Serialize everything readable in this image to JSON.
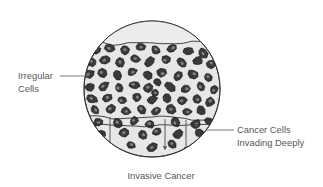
{
  "figure": {
    "caption": "Invasive Cancer",
    "field_shape": "circle",
    "colors": {
      "background": "#ffffff",
      "field_fill": "#e7e7e7",
      "field_fill_upper": "#ededed",
      "field_outline": "#2b2b2b",
      "cell_fill": "#3a3a3a",
      "cell_outline": "#111111",
      "nucleus_fill": "#8f8f8f",
      "membrane_line": "#2b2b2b",
      "arrow": "#4a4a4a",
      "leader_line": "#6a6a6a",
      "text": "#58585a"
    }
  },
  "labels": [
    {
      "id": "irregular-cells",
      "lines": [
        "Irregular",
        "Cells"
      ],
      "side": "left",
      "leader": {
        "x1": 60,
        "y1": 76,
        "x2": 90,
        "y2": 76
      }
    },
    {
      "id": "cancer-cells-invading-deeply",
      "lines": [
        "Cancer Cells",
        "Invading Deeply"
      ],
      "side": "right",
      "leader": {
        "x1": 206,
        "y1": 130,
        "x2": 234,
        "y2": 130
      }
    }
  ],
  "field": {
    "center_x": 152,
    "center_y": 89,
    "radius": 68,
    "surface_line_y": 43,
    "basement_line_y": 118,
    "basement_line2_y": 125
  },
  "arrows": [
    {
      "x": 110,
      "y_start": 117,
      "y_end": 146
    },
    {
      "x": 165,
      "y_start": 119,
      "y_end": 148
    },
    {
      "x": 186,
      "y_start": 120,
      "y_end": 149
    }
  ],
  "cells": [
    {
      "cx": 96,
      "cy": 50,
      "rx": 5.0,
      "ry": 4.0,
      "rot": -20
    },
    {
      "cx": 110,
      "cy": 48,
      "rx": 5.4,
      "ry": 4.2,
      "rot": 15
    },
    {
      "cx": 125,
      "cy": 50,
      "rx": 4.8,
      "ry": 4.4,
      "rot": 40
    },
    {
      "cx": 140,
      "cy": 47,
      "rx": 5.2,
      "ry": 3.8,
      "rot": -10
    },
    {
      "cx": 156,
      "cy": 50,
      "rx": 5.0,
      "ry": 4.3,
      "rot": 25
    },
    {
      "cx": 172,
      "cy": 48,
      "rx": 5.5,
      "ry": 4.0,
      "rot": -35
    },
    {
      "cx": 188,
      "cy": 51,
      "rx": 4.9,
      "ry": 4.2,
      "rot": 10
    },
    {
      "cx": 203,
      "cy": 53,
      "rx": 5.1,
      "ry": 4.0,
      "rot": 50
    },
    {
      "cx": 92,
      "cy": 62,
      "rx": 4.6,
      "ry": 4.2,
      "rot": 30
    },
    {
      "cx": 105,
      "cy": 60,
      "rx": 5.3,
      "ry": 3.9,
      "rot": -25
    },
    {
      "cx": 120,
      "cy": 62,
      "rx": 4.7,
      "ry": 4.4,
      "rot": 60
    },
    {
      "cx": 135,
      "cy": 59,
      "rx": 5.0,
      "ry": 4.0,
      "rot": 5
    },
    {
      "cx": 150,
      "cy": 62,
      "rx": 5.4,
      "ry": 4.3,
      "rot": -40
    },
    {
      "cx": 166,
      "cy": 60,
      "rx": 4.8,
      "ry": 4.1,
      "rot": 20
    },
    {
      "cx": 182,
      "cy": 63,
      "rx": 5.2,
      "ry": 3.9,
      "rot": 45
    },
    {
      "cx": 198,
      "cy": 61,
      "rx": 4.9,
      "ry": 4.3,
      "rot": -15
    },
    {
      "cx": 211,
      "cy": 64,
      "rx": 4.6,
      "ry": 4.0,
      "rot": 35
    },
    {
      "cx": 89,
      "cy": 74,
      "rx": 5.1,
      "ry": 4.2,
      "rot": -30
    },
    {
      "cx": 102,
      "cy": 73,
      "rx": 4.8,
      "ry": 4.4,
      "rot": 15
    },
    {
      "cx": 117,
      "cy": 75,
      "rx": 5.3,
      "ry": 3.9,
      "rot": 55
    },
    {
      "cx": 132,
      "cy": 72,
      "rx": 4.7,
      "ry": 4.2,
      "rot": -20
    },
    {
      "cx": 147,
      "cy": 75,
      "rx": 5.0,
      "ry": 4.0,
      "rot": 30
    },
    {
      "cx": 162,
      "cy": 73,
      "rx": 5.4,
      "ry": 4.3,
      "rot": 0
    },
    {
      "cx": 178,
      "cy": 76,
      "rx": 4.9,
      "ry": 4.1,
      "rot": -45
    },
    {
      "cx": 193,
      "cy": 74,
      "rx": 5.2,
      "ry": 4.2,
      "rot": 25
    },
    {
      "cx": 208,
      "cy": 77,
      "rx": 4.6,
      "ry": 3.9,
      "rot": 40
    },
    {
      "cx": 90,
      "cy": 87,
      "rx": 4.9,
      "ry": 4.3,
      "rot": 20
    },
    {
      "cx": 104,
      "cy": 86,
      "rx": 5.2,
      "ry": 4.0,
      "rot": -35
    },
    {
      "cx": 119,
      "cy": 88,
      "rx": 4.7,
      "ry": 4.4,
      "rot": 50
    },
    {
      "cx": 134,
      "cy": 85,
      "rx": 5.1,
      "ry": 3.9,
      "rot": 10
    },
    {
      "cx": 148,
      "cy": 88,
      "rx": 4.8,
      "ry": 4.2,
      "rot": -25
    },
    {
      "cx": 157,
      "cy": 82,
      "rx": 4.2,
      "ry": 3.6,
      "rot": 60
    },
    {
      "cx": 170,
      "cy": 87,
      "rx": 5.3,
      "ry": 4.1,
      "rot": 35
    },
    {
      "cx": 186,
      "cy": 89,
      "rx": 4.9,
      "ry": 4.3,
      "rot": -10
    },
    {
      "cx": 201,
      "cy": 87,
      "rx": 5.0,
      "ry": 4.0,
      "rot": 45
    },
    {
      "cx": 214,
      "cy": 90,
      "rx": 4.5,
      "ry": 3.8,
      "rot": -30
    },
    {
      "cx": 92,
      "cy": 99,
      "rx": 5.2,
      "ry": 4.1,
      "rot": 25
    },
    {
      "cx": 107,
      "cy": 98,
      "rx": 4.8,
      "ry": 4.4,
      "rot": -40
    },
    {
      "cx": 122,
      "cy": 100,
      "rx": 5.0,
      "ry": 3.9,
      "rot": 15
    },
    {
      "cx": 137,
      "cy": 97,
      "rx": 4.7,
      "ry": 4.2,
      "rot": 55
    },
    {
      "cx": 152,
      "cy": 100,
      "rx": 5.3,
      "ry": 4.0,
      "rot": -20
    },
    {
      "cx": 155,
      "cy": 93,
      "rx": 4.0,
      "ry": 3.4,
      "rot": 30
    },
    {
      "cx": 167,
      "cy": 98,
      "rx": 4.9,
      "ry": 4.3,
      "rot": 40
    },
    {
      "cx": 182,
      "cy": 101,
      "rx": 5.1,
      "ry": 4.1,
      "rot": -15
    },
    {
      "cx": 197,
      "cy": 99,
      "rx": 4.6,
      "ry": 3.9,
      "rot": 20
    },
    {
      "cx": 210,
      "cy": 102,
      "rx": 5.0,
      "ry": 4.2,
      "rot": -35
    },
    {
      "cx": 95,
      "cy": 110,
      "rx": 4.8,
      "ry": 4.0,
      "rot": 45
    },
    {
      "cx": 110,
      "cy": 109,
      "rx": 5.2,
      "ry": 4.3,
      "rot": -25
    },
    {
      "cx": 126,
      "cy": 111,
      "rx": 4.7,
      "ry": 3.9,
      "rot": 10
    },
    {
      "cx": 141,
      "cy": 109,
      "rx": 5.0,
      "ry": 4.2,
      "rot": 50
    },
    {
      "cx": 156,
      "cy": 111,
      "rx": 4.9,
      "ry": 4.0,
      "rot": -30
    },
    {
      "cx": 171,
      "cy": 109,
      "rx": 5.3,
      "ry": 4.3,
      "rot": 25
    },
    {
      "cx": 187,
      "cy": 112,
      "rx": 4.6,
      "ry": 3.8,
      "rot": -5
    },
    {
      "cx": 201,
      "cy": 110,
      "rx": 5.1,
      "ry": 4.2,
      "rot": 40
    },
    {
      "cx": 98,
      "cy": 122,
      "rx": 4.9,
      "ry": 4.1,
      "rot": -20
    },
    {
      "cx": 118,
      "cy": 123,
      "rx": 5.1,
      "ry": 4.3,
      "rot": 30
    },
    {
      "cx": 134,
      "cy": 121,
      "rx": 4.7,
      "ry": 3.9,
      "rot": -45
    },
    {
      "cx": 150,
      "cy": 124,
      "rx": 5.0,
      "ry": 4.2,
      "rot": 15
    },
    {
      "cx": 175,
      "cy": 122,
      "rx": 4.8,
      "ry": 4.0,
      "rot": 55
    },
    {
      "cx": 196,
      "cy": 124,
      "rx": 5.2,
      "ry": 4.3,
      "rot": -10
    },
    {
      "cx": 209,
      "cy": 121,
      "rx": 4.5,
      "ry": 3.8,
      "rot": 35
    },
    {
      "cx": 101,
      "cy": 134,
      "rx": 4.7,
      "ry": 4.0,
      "rot": 20
    },
    {
      "cx": 124,
      "cy": 133,
      "rx": 5.0,
      "ry": 4.2,
      "rot": -35
    },
    {
      "cx": 143,
      "cy": 135,
      "rx": 4.8,
      "ry": 3.9,
      "rot": 45
    },
    {
      "cx": 157,
      "cy": 132,
      "rx": 4.5,
      "ry": 4.1,
      "rot": 0
    },
    {
      "cx": 178,
      "cy": 134,
      "rx": 5.1,
      "ry": 4.2,
      "rot": -25
    },
    {
      "cx": 199,
      "cy": 133,
      "rx": 4.6,
      "ry": 3.8,
      "rot": 30
    },
    {
      "cx": 131,
      "cy": 145,
      "rx": 4.6,
      "ry": 3.9,
      "rot": 25
    },
    {
      "cx": 152,
      "cy": 147,
      "rx": 4.8,
      "ry": 4.1,
      "rot": -30
    },
    {
      "cx": 172,
      "cy": 144,
      "rx": 4.5,
      "ry": 3.8,
      "rot": 40
    }
  ]
}
